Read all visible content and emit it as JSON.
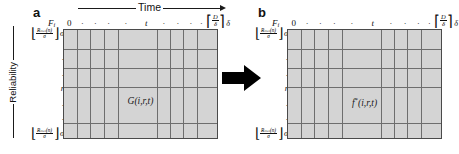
{
  "figure": {
    "axis_time_label": "Time",
    "axis_reliability_label": "Reliability",
    "arrow_transform": "transform-arrow"
  },
  "panels": [
    {
      "letter": "a",
      "matrix_label": "G(i,r,t)",
      "matrix_label_star": "",
      "corner_label": "F",
      "corner_sub": "i",
      "column_headers": [
        "0",
        ".",
        ".",
        ".",
        ".",
        "t",
        ".",
        ".",
        ".",
        "."
      ],
      "ceil_numerator": "D",
      "ceil_denominator": "δ",
      "right_delta": "δ",
      "row_labels": {
        "top_floor_num": "Rₘᵢₙ(n)",
        "top_floor_den": "σ",
        "top_sigma": "σ",
        "middle": "r",
        "dots": ".",
        "bottom_floor_num": "Rₘᵢₙ(n)",
        "bottom_floor_den": "σ",
        "bottom_sigma": "σ"
      }
    },
    {
      "letter": "b",
      "matrix_label": "f",
      "matrix_label_star": "*",
      "matrix_label_rest": "(i,r,t)",
      "corner_label": "F",
      "corner_sub": "i",
      "column_headers": [
        "0",
        ".",
        ".",
        ".",
        ".",
        "t",
        ".",
        ".",
        ".",
        "."
      ],
      "ceil_numerator": "D",
      "ceil_denominator": "δ",
      "right_delta": "δ",
      "row_labels": {
        "top_floor_num": "Rₘᵢₙ(n)",
        "top_floor_den": "σ",
        "top_sigma": "σ",
        "middle": "r",
        "dots": ".",
        "bottom_floor_num": "Rₘᵢₙ(n)",
        "bottom_floor_den": "σ",
        "bottom_sigma": "σ"
      }
    }
  ],
  "colors": {
    "matrix_fill": "#d4d4d4",
    "matrix_border": "#4a4a4a",
    "grid_line": "#6e6e6e",
    "ink": "#111111",
    "arrow": "#000000",
    "background": "#ffffff"
  },
  "grid": {
    "vertical_fractions": [
      0.085,
      0.17,
      0.255,
      0.345,
      0.6,
      0.685,
      0.77,
      0.855
    ],
    "horizontal_fractions": [
      0.175,
      0.345,
      0.515,
      0.845
    ]
  }
}
